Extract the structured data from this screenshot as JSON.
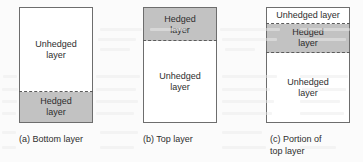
{
  "figure": {
    "colors": {
      "page_background": "#fbfbfb",
      "box_outline": "#6d6d6d",
      "hedged_fill": "#c2c2c2",
      "unhedged_fill": "#ffffff",
      "divider": "#5b5b5b",
      "text": "#2e2e2e"
    },
    "panels": [
      {
        "id": "a",
        "caption": "(a) Bottom layer",
        "bands": [
          {
            "name": "unhedged-layer",
            "label": "Unhedged\nlayer",
            "fill": "unhedged"
          },
          {
            "name": "hedged-layer",
            "label": "Hedged\nlayer",
            "fill": "hedged"
          }
        ]
      },
      {
        "id": "b",
        "caption": "(b) Top layer",
        "bands": [
          {
            "name": "hedged-layer",
            "label": "Hedged\nlayer",
            "fill": "hedged"
          },
          {
            "name": "unhedged-layer",
            "label": "Unhedged\nlayer",
            "fill": "unhedged"
          }
        ]
      },
      {
        "id": "c",
        "caption": "(c) Portion of\ntop layer",
        "bands": [
          {
            "name": "unhedged-layer-top",
            "label": "Unhedged layer",
            "fill": "unhedged"
          },
          {
            "name": "hedged-layer",
            "label": "Hedged\nlayer",
            "fill": "hedged"
          },
          {
            "name": "unhedged-layer-bottom",
            "label": "Unhedged\nlayer",
            "fill": "unhedged"
          }
        ]
      }
    ]
  }
}
